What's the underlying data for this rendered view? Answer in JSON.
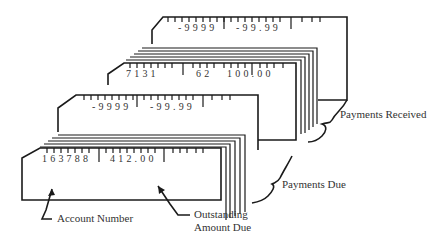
{
  "diagram": {
    "files": [
      {
        "name": "Payments Received",
        "label": "Payments Received",
        "cards": [
          {
            "role": "format-card",
            "fields": [
              "-9999",
              "-99.99"
            ]
          },
          {
            "role": "data-card",
            "fields": [
              "7131",
              "62",
              "100.00"
            ]
          }
        ]
      },
      {
        "name": "Payments Due",
        "label": "Payments Due",
        "cards": [
          {
            "role": "format-card",
            "fields": [
              "-9999",
              "-99.99"
            ]
          },
          {
            "role": "data-card",
            "fields": [
              "163788",
              "412.00"
            ]
          }
        ]
      }
    ],
    "callouts": {
      "account_number": "Account Number",
      "outstanding_line1": "Outstanding",
      "outstanding_line2": "Amount Due"
    }
  }
}
